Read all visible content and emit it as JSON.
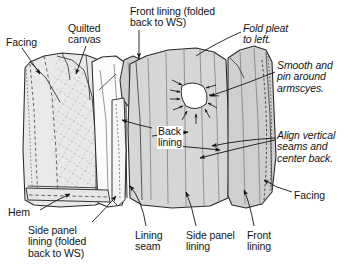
{
  "figure": {
    "kind": "sewing-instruction-diagram",
    "background_color": "#ffffff",
    "ink_color": "#1b1b1b",
    "fabric_fill_light": "#efefef",
    "fabric_fill_mid": "#d9d9d9",
    "fabric_fill_dark": "#c2c2c2"
  },
  "callouts": [
    {
      "id": "facing-left",
      "text": "Facing",
      "style": "plain",
      "x": 6,
      "y": 37
    },
    {
      "id": "quilted-canvas",
      "text": "Quilted\ncanvas",
      "style": "plain",
      "x": 68,
      "y": 23
    },
    {
      "id": "front-lining-folded",
      "text": "Front lining (folded\nback to WS)",
      "style": "plain",
      "x": 130,
      "y": 6
    },
    {
      "id": "fold-pleat",
      "text": "Fold pleat\nto left.",
      "style": "italic",
      "x": 243,
      "y": 23
    },
    {
      "id": "smooth-pin",
      "text": "Smooth and\npin around\narmscyes.",
      "style": "italic",
      "x": 277,
      "y": 60
    },
    {
      "id": "back-lining",
      "text": "Back\nlining",
      "style": "onfabric",
      "x": 157,
      "y": 126
    },
    {
      "id": "align-vertical",
      "text": "Align vertical\nseams and\ncenter back.",
      "style": "italic",
      "x": 277,
      "y": 130
    },
    {
      "id": "facing-right",
      "text": "Facing",
      "style": "plain",
      "x": 294,
      "y": 190
    },
    {
      "id": "hem",
      "text": "Hem",
      "style": "plain",
      "x": 8,
      "y": 207
    },
    {
      "id": "side-panel-lining-folded",
      "text": "Side panel\nlining (folded\nback to WS)",
      "style": "plain",
      "x": 28,
      "y": 225
    },
    {
      "id": "lining-seam",
      "text": "Lining\nseam",
      "style": "plain",
      "x": 135,
      "y": 230
    },
    {
      "id": "side-panel-lining",
      "text": "Side panel\nlining",
      "style": "plain",
      "x": 186,
      "y": 230
    },
    {
      "id": "front-lining",
      "text": "Front\nlining",
      "style": "plain",
      "x": 247,
      "y": 230
    }
  ]
}
